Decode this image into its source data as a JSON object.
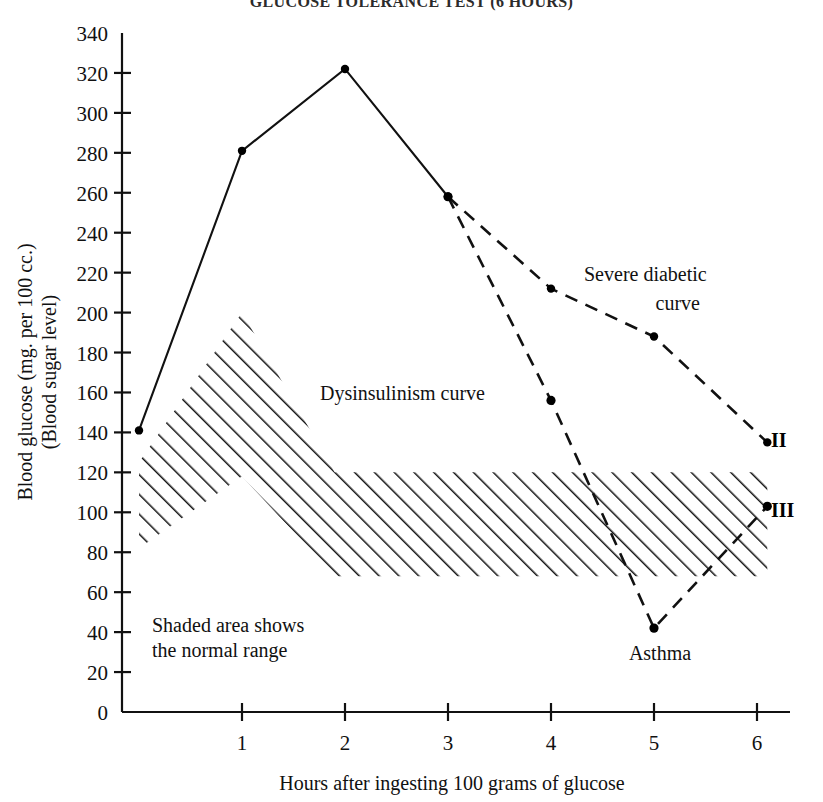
{
  "title": "GLUCOSE TOLERANCE TEST (6 HOURS)",
  "axes": {
    "ylabel_line1": "Blood glucose (mg. per 100 cc.)",
    "ylabel_line2": "(Blood sugar level)",
    "xlabel": "Hours after ingesting 100 grams of glucose",
    "yticks": [
      0,
      20,
      40,
      60,
      80,
      100,
      120,
      140,
      160,
      180,
      200,
      220,
      240,
      260,
      280,
      300,
      320,
      340
    ],
    "xticks": [
      1,
      2,
      3,
      4,
      5,
      6
    ]
  },
  "annotations": {
    "severe_line1": "Severe diabetic",
    "severe_line2": "curve",
    "dysinsulinism": "Dysinsulinism curve",
    "asthma": "Asthma",
    "shaded_line1": "Shaded area shows",
    "shaded_line2": "the normal range",
    "endpoint_ii": "II",
    "endpoint_iii": "III"
  },
  "chart_data": {
    "type": "line",
    "title": "GLUCOSE TOLERANCE TEST (6 HOURS)",
    "xlabel": "Hours after ingesting 100 grams of glucose",
    "ylabel": "Blood glucose (mg. per 100 cc.) (Blood sugar level)",
    "xlim": [
      0,
      6.15
    ],
    "ylim": [
      0,
      340
    ],
    "xticks": [
      1,
      2,
      3,
      4,
      5,
      6
    ],
    "yticks": [
      0,
      20,
      40,
      60,
      80,
      100,
      120,
      140,
      160,
      180,
      200,
      220,
      240,
      260,
      280,
      300,
      320,
      340
    ],
    "grid": false,
    "legend": "annotated inline",
    "series": [
      {
        "name": "Common rising limb (solid)",
        "style": "solid",
        "x": [
          0,
          1,
          2,
          3
        ],
        "values": [
          141,
          281,
          322,
          258
        ]
      },
      {
        "name": "Severe diabetic curve",
        "style": "dashed",
        "endpoint_label": "II",
        "x": [
          3,
          4,
          5,
          6.1
        ],
        "values": [
          258,
          212,
          188,
          135
        ]
      },
      {
        "name": "Dysinsulinism curve",
        "style": "dashed",
        "endpoint_label": "III",
        "x": [
          3,
          4,
          5,
          6.1
        ],
        "values": [
          258,
          156,
          42,
          103
        ],
        "point_annotations": [
          {
            "x": 5,
            "y": 42,
            "label": "Asthma"
          }
        ]
      }
    ],
    "shaded_band": {
      "name": "Normal range",
      "note": "Shaded area shows the normal range",
      "hatch": "diagonal lines",
      "x": [
        0,
        1,
        1.9,
        6.1
      ],
      "upper": [
        125,
        200,
        120,
        120
      ],
      "lower": [
        82,
        118,
        68,
        68
      ]
    }
  }
}
